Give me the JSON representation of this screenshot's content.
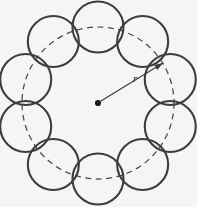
{
  "figure": {
    "background_color": "#f5f5f3",
    "width": 197,
    "height": 207
  },
  "geometry": {
    "center_x": 98,
    "center_y": 103,
    "guide_circle_radius": 76,
    "petal_count": 10,
    "petal_radius": 25.5,
    "petal_center_offset": 76
  },
  "style": {
    "petal_stroke_color": "#3d3d3d",
    "petal_stroke_width": 2.1,
    "guide_stroke_color": "#4a4a4a",
    "guide_stroke_width": 1.25,
    "guide_dash_pattern": "6 4.5",
    "radius_stroke_color": "#3a3a3a",
    "center_dot_color": "#1c1c1c",
    "center_dot_radius": 3.1
  },
  "annotations": {
    "radius_label": "r",
    "radius_label_x": 133,
    "radius_label_y": 82,
    "radius_arrow_start_x": 101,
    "radius_arrow_start_y": 101,
    "radius_arrow_end_x": 163,
    "radius_arrow_end_y": 63,
    "radius_arrow_angle_deg": -31.5
  },
  "chart_data": {
    "type": "scatter",
    "xlabel": "",
    "ylabel": "",
    "center": [
      98,
      103
    ],
    "guide_radius": 76,
    "petal_count": 10,
    "petal_radius": 25.5,
    "petal_centers_deg": [
      -90,
      -54,
      -18,
      18,
      54,
      90,
      126,
      162,
      198,
      234
    ],
    "legend": [],
    "annotations": [
      {
        "text": "r",
        "x": 133,
        "y": 82,
        "style": "italic"
      }
    ]
  }
}
